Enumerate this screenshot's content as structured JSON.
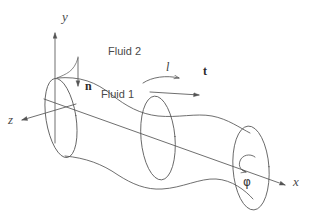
{
  "figure": {
    "kind": "technical-line-diagram",
    "background_color": "#ffffff",
    "stroke_color": "#555555",
    "text_color": "#3f3f3f"
  },
  "axes": {
    "origin": {
      "x": 55,
      "y": 105
    },
    "items": [
      {
        "key": "y",
        "label": "y",
        "style": "italic-serif",
        "direction": "up",
        "tip": {
          "x": 55,
          "y": 31
        },
        "label_pos": {
          "x": 62,
          "y": 10
        }
      },
      {
        "key": "z",
        "label": "z",
        "style": "italic-serif",
        "direction": "lower-left",
        "tip": {
          "x": 20,
          "y": 121
        },
        "label_pos": {
          "x": 8,
          "y": 120
        }
      },
      {
        "key": "x",
        "label": "x",
        "style": "italic-serif",
        "direction": "lower-right",
        "tip": {
          "x": 287,
          "y": 186
        },
        "label_pos": {
          "x": 293,
          "y": 181
        }
      }
    ]
  },
  "annotations": [
    {
      "key": "fluid2",
      "label": "Fluid 2",
      "style": "sans",
      "pos": {
        "x": 108,
        "y": 52
      }
    },
    {
      "key": "fluid1",
      "label": "Fluid 1",
      "style": "sans",
      "pos": {
        "x": 101,
        "y": 95
      }
    },
    {
      "key": "normal",
      "label": "n",
      "style": "bold-serif",
      "pos": {
        "x": 86,
        "y": 85
      }
    },
    {
      "key": "tangent",
      "label": "t",
      "style": "bold-serif",
      "pos": {
        "x": 204,
        "y": 70
      }
    },
    {
      "key": "arclen",
      "label": "l",
      "style": "italic-serif",
      "pos": {
        "x": 167,
        "y": 66
      }
    },
    {
      "key": "phi",
      "label": "φ",
      "style": "greek",
      "pos": {
        "x": 244,
        "y": 182
      }
    }
  ],
  "vectors": [
    {
      "key": "n-arrow",
      "name": "normal-vector-arrow",
      "from": {
        "x": 78,
        "y": 57
      },
      "to": {
        "x": 78,
        "y": 86
      }
    },
    {
      "key": "t-arrow",
      "name": "tangent-vector-arrow",
      "from": {
        "x": 152,
        "y": 92
      },
      "to": {
        "x": 199,
        "y": 95
      }
    },
    {
      "key": "l-arc",
      "name": "arclength-curved-arrow",
      "from": {
        "x": 145,
        "y": 82
      },
      "to": {
        "x": 178,
        "y": 78
      }
    },
    {
      "key": "phi-arc",
      "name": "phi-rotation-arrow",
      "center": {
        "x": 247,
        "y": 163
      }
    }
  ],
  "shapes": {
    "ellipses": [
      {
        "key": "left",
        "name": "cross-section-left",
        "cx": 61,
        "cy": 118,
        "rx": 15,
        "ry": 40,
        "rotation": -9
      },
      {
        "key": "middle",
        "name": "cross-section-middle",
        "cx": 158,
        "cy": 138,
        "rx": 17,
        "ry": 42,
        "rotation": -5
      },
      {
        "key": "right",
        "name": "cross-section-right",
        "cx": 251,
        "cy": 168,
        "rx": 18,
        "ry": 42,
        "rotation": -4
      }
    ],
    "tube_outlines": [
      {
        "key": "top",
        "name": "tube-upper-surface-curve"
      },
      {
        "key": "bottom",
        "name": "tube-lower-surface-curve"
      }
    ]
  }
}
